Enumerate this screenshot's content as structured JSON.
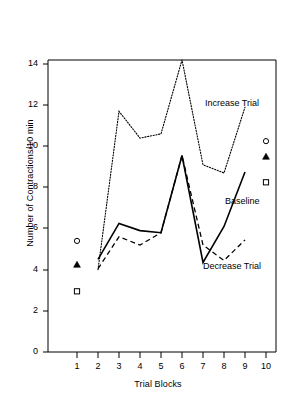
{
  "chart_data": {
    "type": "line",
    "title": "",
    "xlabel": "Trial Blocks",
    "ylabel": "Number of Contractions/10 min",
    "x": [
      1,
      2,
      3,
      4,
      5,
      6,
      7,
      8,
      9,
      10
    ],
    "xlim": [
      0.4,
      10.7
    ],
    "ylim": [
      0,
      15.2
    ],
    "xticks": [
      "1",
      "2",
      "3",
      "4",
      "5",
      "6",
      "7",
      "8",
      "9",
      "10"
    ],
    "yticks": [
      "0",
      "2",
      "4",
      "6",
      "8",
      "10",
      "12",
      "14"
    ],
    "ytick_values": [
      0,
      2,
      4,
      6,
      8,
      10,
      12,
      14
    ],
    "grid": false,
    "legend_position": "inline-annotations",
    "series": [
      {
        "name": "Increase Trial",
        "style": "dotted",
        "x": [
          2,
          3,
          4,
          5,
          6,
          7,
          8,
          9
        ],
        "values": [
          4.0,
          11.7,
          10.4,
          10.6,
          14.2,
          9.1,
          8.7,
          11.9
        ],
        "label": "Increase Trial"
      },
      {
        "name": "Baseline",
        "style": "solid",
        "x": [
          2,
          3,
          4,
          5,
          6,
          7,
          8,
          9
        ],
        "values": [
          4.5,
          6.25,
          5.9,
          5.8,
          9.55,
          4.35,
          6.1,
          8.75
        ],
        "label": "Baseline"
      },
      {
        "name": "Decrease Trial",
        "style": "dashed",
        "x": [
          2,
          3,
          4,
          5,
          6,
          7,
          8,
          9
        ],
        "values": [
          4.05,
          5.6,
          5.2,
          5.8,
          9.55,
          5.2,
          4.45,
          5.45
        ],
        "label": "Decrease Trial"
      }
    ],
    "markers": [
      {
        "name": "increase-marker-block1",
        "symbol": "open-circle",
        "x": 1,
        "y": 5.4
      },
      {
        "name": "baseline-marker-block1",
        "symbol": "filled-triangle",
        "x": 1,
        "y": 4.25
      },
      {
        "name": "decrease-marker-block1",
        "symbol": "open-square",
        "x": 1,
        "y": 2.95
      },
      {
        "name": "increase-marker-block10",
        "symbol": "open-circle",
        "x": 10,
        "y": 10.25
      },
      {
        "name": "baseline-marker-block10",
        "symbol": "filled-triangle",
        "x": 10,
        "y": 9.5
      },
      {
        "name": "decrease-marker-block10",
        "symbol": "open-square",
        "x": 10,
        "y": 8.25
      }
    ],
    "colors": {
      "axis": "#000000",
      "increase": "#000000",
      "baseline": "#000000",
      "decrease": "#000000",
      "background": "#ffffff"
    }
  }
}
